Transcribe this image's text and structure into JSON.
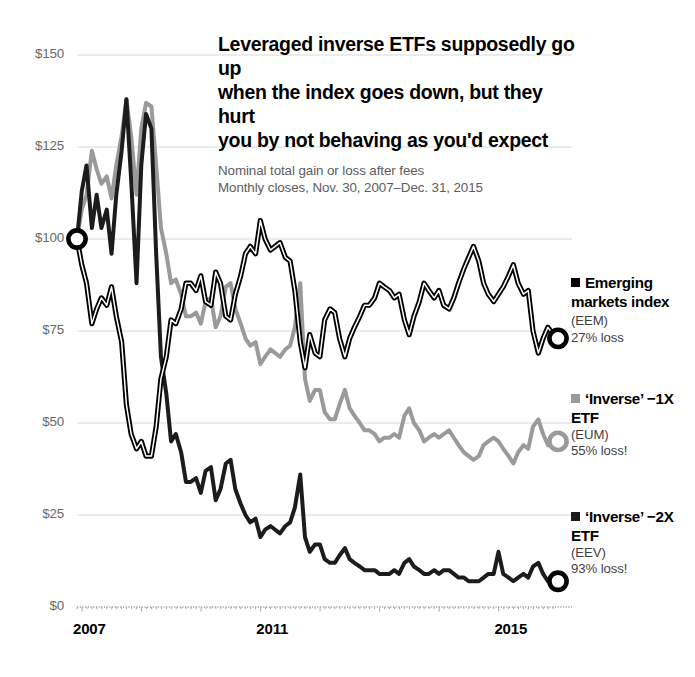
{
  "chart_data": {
    "type": "line",
    "title": "Leveraged inverse ETFs supposedly go up when the index goes down, but they hurt you by not behaving as you'd expect",
    "title_lines": [
      "Leveraged inverse ETFs supposedly go up",
      "when the index goes down, but they hurt",
      "you by not behaving as you'd expect"
    ],
    "subtitle_lines": [
      "Nominal total gain or loss after fees",
      "Monthly closes, Nov. 30, 2007–Dec. 31, 2015"
    ],
    "xlabel": "",
    "ylabel": "",
    "ylim": [
      0,
      150
    ],
    "xlim": [
      2007.92,
      2016.0
    ],
    "grid": true,
    "legend_position": "right",
    "ytick_labels": [
      "$150",
      "$125",
      "$100",
      "$75",
      "$50",
      "$25",
      "$0"
    ],
    "ytick_values": [
      150,
      125,
      100,
      75,
      50,
      25,
      0
    ],
    "xtick_labels": [
      "2007",
      "2011",
      "2015"
    ],
    "xtick_values": [
      2007.92,
      2011.0,
      2015.0
    ],
    "start_value": 100,
    "series": [
      {
        "name": "Emerging markets index",
        "ticker": "EEM",
        "annotation": "27% loss",
        "color": "#000000",
        "style": "outlined-white-core",
        "end_value": 73,
        "x": [
          2007.92,
          2008.0,
          2008.08,
          2008.17,
          2008.25,
          2008.33,
          2008.42,
          2008.5,
          2008.58,
          2008.67,
          2008.75,
          2008.83,
          2008.92,
          2009.0,
          2009.08,
          2009.17,
          2009.25,
          2009.33,
          2009.42,
          2009.5,
          2009.58,
          2009.67,
          2009.75,
          2009.83,
          2009.92,
          2010.0,
          2010.08,
          2010.17,
          2010.25,
          2010.33,
          2010.42,
          2010.5,
          2010.58,
          2010.67,
          2010.75,
          2010.83,
          2010.92,
          2011.0,
          2011.08,
          2011.17,
          2011.25,
          2011.33,
          2011.42,
          2011.5,
          2011.58,
          2011.67,
          2011.75,
          2011.83,
          2011.92,
          2012.0,
          2012.08,
          2012.17,
          2012.25,
          2012.33,
          2012.42,
          2012.5,
          2012.58,
          2012.67,
          2012.75,
          2012.83,
          2012.92,
          2013.0,
          2013.08,
          2013.17,
          2013.25,
          2013.33,
          2013.42,
          2013.5,
          2013.58,
          2013.67,
          2013.75,
          2013.83,
          2013.92,
          2014.0,
          2014.08,
          2014.17,
          2014.25,
          2014.33,
          2014.42,
          2014.5,
          2014.58,
          2014.67,
          2014.75,
          2014.83,
          2014.92,
          2015.0,
          2015.08,
          2015.17,
          2015.25,
          2015.33,
          2015.42,
          2015.5,
          2015.58,
          2015.67,
          2015.75,
          2015.83,
          2015.92,
          2016.0
        ],
        "y": [
          100,
          93,
          88,
          77,
          81,
          84,
          82,
          87,
          79,
          72,
          55,
          47,
          43,
          45,
          41,
          41,
          49,
          62,
          68,
          78,
          77,
          81,
          88,
          88,
          86,
          90,
          83,
          82,
          91,
          88,
          79,
          78,
          85,
          90,
          96,
          98,
          96,
          105,
          100,
          97,
          98,
          99,
          95,
          94,
          86,
          72,
          65,
          74,
          69,
          68,
          78,
          81,
          80,
          73,
          68,
          73,
          76,
          79,
          82,
          82,
          84,
          88,
          87,
          86,
          84,
          85,
          78,
          74,
          79,
          83,
          88,
          86,
          84,
          86,
          82,
          81,
          84,
          88,
          92,
          95,
          98,
          94,
          88,
          85,
          83,
          85,
          87,
          90,
          93,
          88,
          85,
          86,
          75,
          69,
          73,
          76,
          74,
          73
        ],
        "marker_start": {
          "x": 2007.92,
          "y": 100
        },
        "marker_end": {
          "x": 2016.0,
          "y": 73
        }
      },
      {
        "name": "'Inverse' −1X ETF",
        "ticker": "EUM",
        "annotation": "55% loss!",
        "color": "#9a9a9a",
        "style": "solid",
        "end_value": 45,
        "x": [
          2007.92,
          2008.0,
          2008.08,
          2008.17,
          2008.25,
          2008.33,
          2008.42,
          2008.5,
          2008.58,
          2008.67,
          2008.75,
          2008.83,
          2008.92,
          2009.0,
          2009.08,
          2009.17,
          2009.25,
          2009.33,
          2009.42,
          2009.5,
          2009.58,
          2009.67,
          2009.75,
          2009.83,
          2009.92,
          2010.0,
          2010.08,
          2010.17,
          2010.25,
          2010.33,
          2010.42,
          2010.5,
          2010.58,
          2010.67,
          2010.75,
          2010.83,
          2010.92,
          2011.0,
          2011.08,
          2011.17,
          2011.25,
          2011.33,
          2011.42,
          2011.5,
          2011.58,
          2011.67,
          2011.75,
          2011.83,
          2011.92,
          2012.0,
          2012.08,
          2012.17,
          2012.25,
          2012.33,
          2012.42,
          2012.5,
          2012.58,
          2012.67,
          2012.75,
          2012.83,
          2012.92,
          2013.0,
          2013.08,
          2013.17,
          2013.25,
          2013.33,
          2013.42,
          2013.5,
          2013.58,
          2013.67,
          2013.75,
          2013.83,
          2013.92,
          2014.0,
          2014.08,
          2014.17,
          2014.25,
          2014.33,
          2014.42,
          2014.5,
          2014.58,
          2014.67,
          2014.75,
          2014.83,
          2014.92,
          2015.0,
          2015.08,
          2015.17,
          2015.25,
          2015.33,
          2015.42,
          2015.5,
          2015.58,
          2015.67,
          2015.75,
          2015.83,
          2015.92,
          2016.0
        ],
        "y": [
          100,
          108,
          112,
          124,
          119,
          115,
          117,
          111,
          120,
          128,
          138,
          128,
          112,
          130,
          137,
          136,
          120,
          103,
          96,
          88,
          89,
          85,
          79,
          79,
          80,
          77,
          83,
          84,
          76,
          79,
          87,
          88,
          81,
          77,
          73,
          71,
          72,
          66,
          68,
          70,
          69,
          68,
          70,
          71,
          76,
          88,
          62,
          56,
          59,
          59,
          53,
          51,
          51,
          55,
          59,
          54,
          52,
          50,
          48,
          48,
          47,
          45,
          46,
          46,
          47,
          46,
          52,
          54,
          50,
          48,
          45,
          46,
          47,
          46,
          47,
          48,
          46,
          44,
          42,
          41,
          40,
          41,
          44,
          45,
          46,
          45,
          43,
          41,
          39,
          42,
          44,
          43,
          49,
          51,
          47,
          44,
          45,
          45
        ],
        "marker_end": {
          "x": 2016.0,
          "y": 45
        }
      },
      {
        "name": "'Inverse' −2X ETF",
        "ticker": "EEV",
        "annotation": "93% loss!",
        "color": "#1c1c1c",
        "style": "solid",
        "end_value": 7,
        "x": [
          2007.92,
          2008.0,
          2008.08,
          2008.17,
          2008.25,
          2008.33,
          2008.42,
          2008.5,
          2008.58,
          2008.67,
          2008.75,
          2008.83,
          2008.92,
          2009.0,
          2009.08,
          2009.17,
          2009.25,
          2009.33,
          2009.42,
          2009.5,
          2009.58,
          2009.67,
          2009.75,
          2009.83,
          2009.92,
          2010.0,
          2010.08,
          2010.17,
          2010.25,
          2010.33,
          2010.42,
          2010.5,
          2010.58,
          2010.67,
          2010.75,
          2010.83,
          2010.92,
          2011.0,
          2011.08,
          2011.17,
          2011.25,
          2011.33,
          2011.42,
          2011.5,
          2011.58,
          2011.67,
          2011.75,
          2011.83,
          2011.92,
          2012.0,
          2012.08,
          2012.17,
          2012.25,
          2012.33,
          2012.42,
          2012.5,
          2012.58,
          2012.67,
          2012.75,
          2012.83,
          2012.92,
          2013.0,
          2013.08,
          2013.17,
          2013.25,
          2013.33,
          2013.42,
          2013.5,
          2013.58,
          2013.67,
          2013.75,
          2013.83,
          2013.92,
          2014.0,
          2014.08,
          2014.17,
          2014.25,
          2014.33,
          2014.42,
          2014.5,
          2014.58,
          2014.67,
          2014.75,
          2014.83,
          2014.92,
          2015.0,
          2015.08,
          2015.17,
          2015.25,
          2015.33,
          2015.42,
          2015.5,
          2015.58,
          2015.67,
          2015.75,
          2015.83,
          2015.92,
          2016.0
        ],
        "y": [
          100,
          113,
          120,
          103,
          112,
          103,
          108,
          96,
          112,
          124,
          138,
          116,
          88,
          120,
          134,
          130,
          96,
          68,
          58,
          45,
          47,
          42,
          34,
          34,
          35,
          31,
          37,
          38,
          29,
          32,
          39,
          40,
          32,
          28,
          25,
          23,
          24,
          19,
          21,
          22,
          21,
          20,
          22,
          23,
          27,
          36,
          19,
          15,
          17,
          17,
          13,
          12,
          12,
          14,
          16,
          13,
          12,
          11,
          10,
          10,
          10,
          9,
          9,
          9,
          10,
          9,
          12,
          13,
          11,
          10,
          9,
          9,
          10,
          9,
          10,
          10,
          9,
          8,
          8,
          7,
          7,
          7,
          8,
          9,
          9,
          15,
          9,
          8,
          7,
          8,
          9,
          8,
          11,
          12,
          9,
          7,
          7,
          7
        ],
        "marker_end": {
          "x": 2016.0,
          "y": 7
        }
      }
    ]
  },
  "legend": [
    {
      "name_bold": "Emerging markets index",
      "ticker": "(EEM)",
      "loss": "27% loss",
      "color": "#000000"
    },
    {
      "name_bold": "‘Inverse’ −1X ETF",
      "ticker": "(EUM)",
      "loss": "55% loss!",
      "color": "#9a9a9a"
    },
    {
      "name_bold": "‘Inverse’ −2X ETF",
      "ticker": "(EEV)",
      "loss": "93% loss!",
      "color": "#1c1c1c"
    }
  ]
}
